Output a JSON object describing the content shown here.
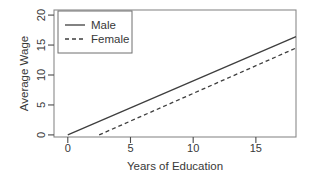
{
  "colors": {
    "background": "#ffffff",
    "plot_border": "#8a8a8a",
    "tick": "#4a4a4a",
    "text": "#383838",
    "data_line": "#3e3e3e",
    "legend_border": "#6f6f6f",
    "legend_background": "#ffffff"
  },
  "chart_data": {
    "type": "line",
    "title": "",
    "xlabel": "Years of Education",
    "ylabel": "Average Wage",
    "x_ticks": [
      0,
      5,
      10,
      15
    ],
    "y_ticks": [
      0,
      5,
      10,
      15,
      20
    ],
    "x_tick_labels": [
      "0",
      "5",
      "10",
      "15"
    ],
    "y_tick_labels": [
      "0",
      "5",
      "10",
      "15",
      "20"
    ],
    "xlim": [
      -1.1,
      18.2
    ],
    "ylim": [
      -0.35,
      20.85
    ],
    "grid": false,
    "legend_position": "top-left",
    "y_tick_label_rotation": 90,
    "series": [
      {
        "name": "Male",
        "line_style": "solid",
        "points": [
          [
            0.0,
            0.0
          ],
          [
            18.2,
            16.4
          ]
        ]
      },
      {
        "name": "Female",
        "line_style": "dashed",
        "points": [
          [
            2.5,
            0.0
          ],
          [
            18.2,
            14.5
          ]
        ]
      }
    ]
  }
}
